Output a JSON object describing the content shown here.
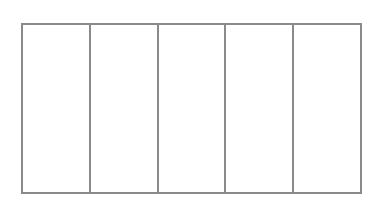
{
  "diagram": {
    "type": "grid",
    "rows": 1,
    "columns": 5,
    "line_color": "#8a8a8a",
    "background": "#ffffff",
    "cells": [
      {
        "label": ""
      },
      {
        "label": ""
      },
      {
        "label": ""
      },
      {
        "label": ""
      },
      {
        "label": ""
      }
    ]
  }
}
